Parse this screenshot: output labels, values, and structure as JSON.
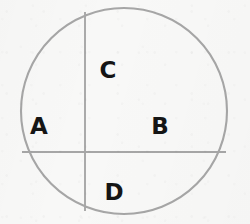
{
  "figure": {
    "background_color": "#f8f8f7",
    "stroke_color": "#a6a6a6",
    "label_color": "#151515",
    "width": 250,
    "height": 224
  },
  "shapes": {
    "circle": {
      "name": "outer circle",
      "cx": 124,
      "cy": 111,
      "r": 103,
      "stroke_width": 2.1
    },
    "vertical_chord": {
      "name": "vertical chord",
      "x": 85,
      "y1": 12,
      "y2": 211,
      "stroke_width": 1.9
    },
    "horizontal_chord": {
      "name": "horizontal chord",
      "y": 152,
      "x1": 22,
      "x2": 226,
      "stroke_width": 1.9
    }
  },
  "labels": [
    {
      "id": "A",
      "text": "A",
      "x": 39,
      "y": 126
    },
    {
      "id": "B",
      "text": "B",
      "x": 160,
      "y": 126
    },
    {
      "id": "C",
      "text": "C",
      "x": 108,
      "y": 70
    },
    {
      "id": "D",
      "text": "D",
      "x": 114,
      "y": 192
    }
  ]
}
